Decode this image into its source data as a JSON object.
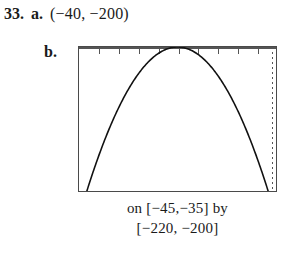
{
  "exercise": {
    "number": "33.",
    "part_a": {
      "letter": "a.",
      "answer": "(−40, −200)"
    },
    "part_b": {
      "letter": "b."
    }
  },
  "calculator": {
    "caption_line1": "on [−45,−35] by",
    "caption_line2": "[−220, −200]",
    "window": {
      "xmin": -45,
      "xmax": -35,
      "ymin": -220,
      "ymax": -200
    },
    "border_color": "#4a4a4a",
    "curve_color": "#111111",
    "axis_color": "#555555",
    "x_tick_count": 10,
    "y_axis_dotted": true
  },
  "chart_data": {
    "type": "line",
    "title": "",
    "xlabel": "",
    "ylabel": "",
    "xlim": [
      -45,
      -35
    ],
    "ylim": [
      -220,
      -200
    ],
    "grid": false,
    "legend": null,
    "annotations": [
      "vertex at (−40, −200)"
    ],
    "series": [
      {
        "name": "parabola",
        "x": [
          -44.6,
          -44.2,
          -43.8,
          -43.4,
          -43.0,
          -42.6,
          -42.2,
          -41.8,
          -41.4,
          -41.0,
          -40.6,
          -40.2,
          -40.0,
          -39.8,
          -39.4,
          -39.0,
          -38.6,
          -38.2,
          -37.8,
          -37.4,
          -37.0,
          -36.6,
          -36.2,
          -35.8,
          -35.4
        ],
        "y": [
          -220.0,
          -217.6,
          -215.4,
          -213.4,
          -211.6,
          -210.0,
          -208.6,
          -207.4,
          -206.4,
          -205.6,
          -205.0,
          -204.6,
          -204.4,
          -204.6,
          -205.0,
          -205.6,
          -206.4,
          -207.4,
          -208.6,
          -210.0,
          -211.6,
          -213.4,
          -215.4,
          -217.6,
          -220.0
        ]
      }
    ]
  }
}
